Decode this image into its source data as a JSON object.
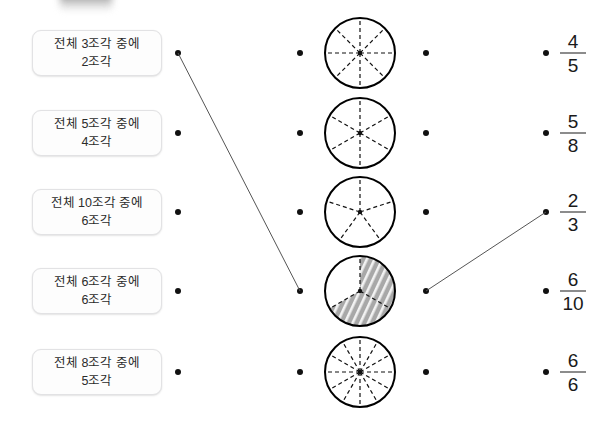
{
  "page": {
    "width": 607,
    "height": 422,
    "background": "#ffffff",
    "line_color": "#555555",
    "dot_color": "#111111",
    "shade_color": "#a8a8a8"
  },
  "decorations": {
    "blurred_blob_label": "blurred-partial-ui-element"
  },
  "left_column": {
    "items": [
      {
        "text": "전체 3조각 중에 2조각",
        "line1": "전체 3조각 중에",
        "line2": "2조각",
        "y": 53
      },
      {
        "text": "전체 5조각 중에 4조각",
        "line1": "전체 5조각 중에",
        "line2": "4조각",
        "y": 133
      },
      {
        "text": "전체 10조각 중에 6조각",
        "line1": "전체 10조각 중에",
        "line2": "6조각",
        "y": 212
      },
      {
        "text": "전체 6조각 중에 6조각",
        "line1": "전체 6조각 중에",
        "line2": "6조각",
        "y": 291
      },
      {
        "text": "전체 8조각 중에 5조각",
        "line1": "전체 8조각 중에",
        "line2": "5조각",
        "y": 372
      }
    ]
  },
  "middle_column": {
    "circles": [
      {
        "name": "circle-8-parts",
        "parts": 8,
        "shaded": 0,
        "y": 53
      },
      {
        "name": "circle-6-parts",
        "parts": 6,
        "shaded": 0,
        "y": 133
      },
      {
        "name": "circle-5-parts",
        "parts": 5,
        "shaded": 0,
        "y": 212
      },
      {
        "name": "circle-3-parts-2-shaded",
        "parts": 3,
        "shaded": 2,
        "y": 291
      },
      {
        "name": "circle-12-parts",
        "parts": 12,
        "shaded": 0,
        "y": 372
      }
    ]
  },
  "right_column": {
    "fractions": [
      {
        "numerator": "4",
        "denominator": "5",
        "y": 53
      },
      {
        "numerator": "5",
        "denominator": "8",
        "y": 133
      },
      {
        "numerator": "2",
        "denominator": "3",
        "y": 212
      },
      {
        "numerator": "6",
        "denominator": "10",
        "y": 291
      },
      {
        "numerator": "6",
        "denominator": "6",
        "y": 372
      }
    ]
  },
  "dot_columns": {
    "x": [
      178,
      300,
      426,
      546
    ]
  },
  "connections": [
    {
      "name": "link-text1-to-circle4",
      "x1": 178,
      "y1": 53,
      "x2": 300,
      "y2": 291
    },
    {
      "name": "link-circle4-to-fraction3",
      "x1": 426,
      "y1": 291,
      "x2": 546,
      "y2": 212
    }
  ]
}
